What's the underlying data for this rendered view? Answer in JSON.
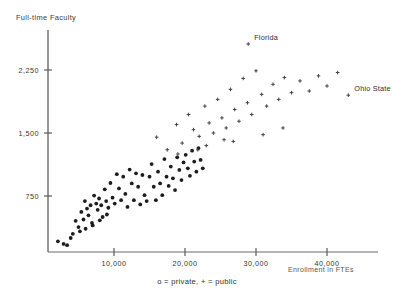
{
  "chart_data": {
    "type": "scatter",
    "title": "",
    "xlabel": "Enrollment in FTEs",
    "ylabel": "Full-time Faculty",
    "xlim": [
      0,
      46000
    ],
    "ylim": [
      0,
      2800
    ],
    "grid": false,
    "legend_position": "bottom-center",
    "xticks": [
      10000,
      20000,
      30000,
      40000
    ],
    "xtick_labels": [
      "10,000",
      "20,000",
      "30,000",
      "40,000"
    ],
    "yticks": [
      750,
      1500,
      2250
    ],
    "ytick_labels": [
      "750",
      "1,500",
      "2,250"
    ],
    "legend_text": "o = private, + = public",
    "series": [
      {
        "name": "private",
        "marker": "circle",
        "color": "#1d1d1d",
        "points": [
          [
            2100,
            210
          ],
          [
            2900,
            180
          ],
          [
            3400,
            165
          ],
          [
            3900,
            250
          ],
          [
            4600,
            455
          ],
          [
            5000,
            380
          ],
          [
            5400,
            560
          ],
          [
            5700,
            470
          ],
          [
            5900,
            690
          ],
          [
            6200,
            600
          ],
          [
            6400,
            520
          ],
          [
            6700,
            640
          ],
          [
            6900,
            430
          ],
          [
            7200,
            755
          ],
          [
            7500,
            660
          ],
          [
            7700,
            585
          ],
          [
            7900,
            720
          ],
          [
            8200,
            640
          ],
          [
            8400,
            500
          ],
          [
            8700,
            830
          ],
          [
            8900,
            690
          ],
          [
            9200,
            610
          ],
          [
            9500,
            905
          ],
          [
            9800,
            730
          ],
          [
            10100,
            660
          ],
          [
            10400,
            1010
          ],
          [
            10700,
            840
          ],
          [
            11000,
            700
          ],
          [
            11300,
            980
          ],
          [
            11600,
            775
          ],
          [
            11900,
            620
          ],
          [
            12200,
            1065
          ],
          [
            12500,
            900
          ],
          [
            12800,
            700
          ],
          [
            13100,
            1020
          ],
          [
            13400,
            860
          ],
          [
            13700,
            650
          ],
          [
            14000,
            1000
          ],
          [
            14300,
            760
          ],
          [
            14600,
            690
          ],
          [
            15000,
            980
          ],
          [
            15300,
            1130
          ],
          [
            15600,
            860
          ],
          [
            15900,
            700
          ],
          [
            16200,
            1040
          ],
          [
            16500,
            900
          ],
          [
            16800,
            760
          ],
          [
            17100,
            1190
          ],
          [
            17400,
            980
          ],
          [
            17700,
            870
          ],
          [
            18000,
            1100
          ],
          [
            18300,
            960
          ],
          [
            18600,
            820
          ],
          [
            18900,
            1210
          ],
          [
            19200,
            1060
          ],
          [
            19500,
            940
          ],
          [
            19800,
            1150
          ],
          [
            20100,
            1240
          ],
          [
            20400,
            1080
          ],
          [
            20700,
            990
          ],
          [
            21000,
            1290
          ],
          [
            21300,
            1160
          ],
          [
            21600,
            1040
          ],
          [
            21900,
            1320
          ],
          [
            22200,
            1180
          ],
          [
            22500,
            1080
          ],
          [
            4200,
            300
          ],
          [
            5200,
            330
          ],
          [
            6000,
            360
          ],
          [
            7000,
            400
          ],
          [
            8000,
            460
          ],
          [
            9000,
            530
          ]
        ]
      },
      {
        "name": "public",
        "marker": "plus",
        "color": "#3a3a3a",
        "points": [
          [
            16000,
            1450
          ],
          [
            17500,
            1300
          ],
          [
            18800,
            1600
          ],
          [
            19600,
            1380
          ],
          [
            20500,
            1720
          ],
          [
            21200,
            1540
          ],
          [
            22000,
            1460
          ],
          [
            22800,
            1820
          ],
          [
            23400,
            1620
          ],
          [
            24000,
            1500
          ],
          [
            24600,
            1900
          ],
          [
            25200,
            1680
          ],
          [
            25800,
            1560
          ],
          [
            26400,
            2020
          ],
          [
            27000,
            1780
          ],
          [
            27600,
            1640
          ],
          [
            28200,
            2150
          ],
          [
            28800,
            1860
          ],
          [
            29400,
            1720
          ],
          [
            30000,
            2240
          ],
          [
            30800,
            1960
          ],
          [
            31500,
            1820
          ],
          [
            32400,
            2080
          ],
          [
            33200,
            1900
          ],
          [
            34000,
            2160
          ],
          [
            35000,
            1980
          ],
          [
            36200,
            2120
          ],
          [
            37500,
            2000
          ],
          [
            38800,
            2180
          ],
          [
            40000,
            2060
          ],
          [
            41500,
            2220
          ],
          [
            28900,
            2560
          ],
          [
            43000,
            1950
          ],
          [
            23000,
            1350
          ],
          [
            25500,
            1420
          ],
          [
            31000,
            1480
          ],
          [
            33800,
            1560
          ],
          [
            19000,
            1250
          ],
          [
            21800,
            1300
          ],
          [
            26800,
            1400
          ]
        ]
      }
    ],
    "annotations": [
      {
        "label": "Florida",
        "x": 28900,
        "y": 2560
      },
      {
        "label": "Ohio State",
        "x": 43000,
        "y": 1950
      }
    ]
  },
  "caption": ""
}
